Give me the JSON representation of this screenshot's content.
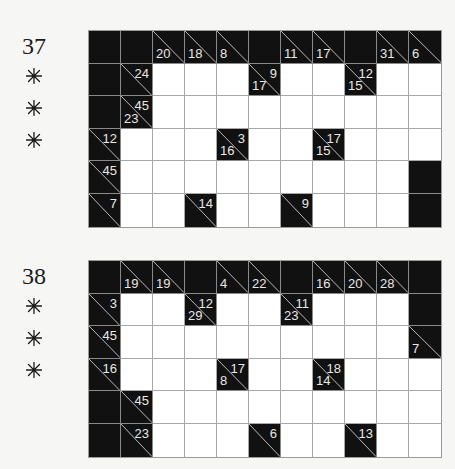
{
  "puzzles": [
    {
      "number": "37",
      "difficulty_icon": "asterisk-icon",
      "difficulty_stars": 3,
      "rows": 6,
      "cols": 11,
      "grid": [
        [
          {
            "t": "B"
          },
          {
            "t": "B"
          },
          {
            "t": "C",
            "down": "20"
          },
          {
            "t": "C",
            "down": "18"
          },
          {
            "t": "C",
            "down": "8"
          },
          {
            "t": "B"
          },
          {
            "t": "C",
            "down": "11"
          },
          {
            "t": "C",
            "down": "17"
          },
          {
            "t": "B"
          },
          {
            "t": "C",
            "down": "31"
          },
          {
            "t": "C",
            "down": "6"
          }
        ],
        [
          {
            "t": "B"
          },
          {
            "t": "C",
            "across": "24"
          },
          {
            "t": "W"
          },
          {
            "t": "W"
          },
          {
            "t": "W"
          },
          {
            "t": "C",
            "across": "9",
            "down": "17"
          },
          {
            "t": "W"
          },
          {
            "t": "W"
          },
          {
            "t": "C",
            "across": "12",
            "down": "15"
          },
          {
            "t": "W"
          },
          {
            "t": "W"
          }
        ],
        [
          {
            "t": "B"
          },
          {
            "t": "C",
            "across": "45",
            "down": "23"
          },
          {
            "t": "W"
          },
          {
            "t": "W"
          },
          {
            "t": "W"
          },
          {
            "t": "W"
          },
          {
            "t": "W"
          },
          {
            "t": "W"
          },
          {
            "t": "W"
          },
          {
            "t": "W"
          },
          {
            "t": "W"
          }
        ],
        [
          {
            "t": "C",
            "across": "12"
          },
          {
            "t": "W"
          },
          {
            "t": "W"
          },
          {
            "t": "W"
          },
          {
            "t": "C",
            "across": "3",
            "down": "16"
          },
          {
            "t": "W"
          },
          {
            "t": "W"
          },
          {
            "t": "C",
            "across": "17",
            "down": "15"
          },
          {
            "t": "W"
          },
          {
            "t": "W"
          },
          {
            "t": "W"
          }
        ],
        [
          {
            "t": "C",
            "across": "45"
          },
          {
            "t": "W"
          },
          {
            "t": "W"
          },
          {
            "t": "W"
          },
          {
            "t": "W"
          },
          {
            "t": "W"
          },
          {
            "t": "W"
          },
          {
            "t": "W"
          },
          {
            "t": "W"
          },
          {
            "t": "W"
          },
          {
            "t": "B"
          }
        ],
        [
          {
            "t": "C",
            "across": "7"
          },
          {
            "t": "W"
          },
          {
            "t": "W"
          },
          {
            "t": "C",
            "across": "14"
          },
          {
            "t": "W"
          },
          {
            "t": "W"
          },
          {
            "t": "C",
            "across": "9"
          },
          {
            "t": "W"
          },
          {
            "t": "W"
          },
          {
            "t": "W"
          },
          {
            "t": "B"
          }
        ]
      ]
    },
    {
      "number": "38",
      "difficulty_icon": "asterisk-icon",
      "difficulty_stars": 3,
      "rows": 6,
      "cols": 11,
      "grid": [
        [
          {
            "t": "B"
          },
          {
            "t": "C",
            "down": "19"
          },
          {
            "t": "C",
            "down": "19"
          },
          {
            "t": "B"
          },
          {
            "t": "C",
            "down": "4"
          },
          {
            "t": "C",
            "down": "22"
          },
          {
            "t": "B"
          },
          {
            "t": "C",
            "down": "16"
          },
          {
            "t": "C",
            "down": "20"
          },
          {
            "t": "C",
            "down": "28"
          },
          {
            "t": "B"
          }
        ],
        [
          {
            "t": "C",
            "across": "3"
          },
          {
            "t": "W"
          },
          {
            "t": "W"
          },
          {
            "t": "C",
            "across": "12",
            "down": "29"
          },
          {
            "t": "W"
          },
          {
            "t": "W"
          },
          {
            "t": "C",
            "across": "11",
            "down": "23"
          },
          {
            "t": "W"
          },
          {
            "t": "W"
          },
          {
            "t": "W"
          },
          {
            "t": "B"
          }
        ],
        [
          {
            "t": "C",
            "across": "45"
          },
          {
            "t": "W"
          },
          {
            "t": "W"
          },
          {
            "t": "W"
          },
          {
            "t": "W"
          },
          {
            "t": "W"
          },
          {
            "t": "W"
          },
          {
            "t": "W"
          },
          {
            "t": "W"
          },
          {
            "t": "W"
          },
          {
            "t": "C",
            "down": "7"
          }
        ],
        [
          {
            "t": "C",
            "across": "16"
          },
          {
            "t": "W"
          },
          {
            "t": "W"
          },
          {
            "t": "W"
          },
          {
            "t": "C",
            "across": "17",
            "down": "8"
          },
          {
            "t": "W"
          },
          {
            "t": "W"
          },
          {
            "t": "C",
            "across": "18",
            "down": "14"
          },
          {
            "t": "W"
          },
          {
            "t": "W"
          },
          {
            "t": "W"
          }
        ],
        [
          {
            "t": "B"
          },
          {
            "t": "C",
            "across": "45"
          },
          {
            "t": "W"
          },
          {
            "t": "W"
          },
          {
            "t": "W"
          },
          {
            "t": "W"
          },
          {
            "t": "W"
          },
          {
            "t": "W"
          },
          {
            "t": "W"
          },
          {
            "t": "W"
          },
          {
            "t": "W"
          }
        ],
        [
          {
            "t": "B"
          },
          {
            "t": "C",
            "across": "23"
          },
          {
            "t": "W"
          },
          {
            "t": "W"
          },
          {
            "t": "W"
          },
          {
            "t": "C",
            "across": "6"
          },
          {
            "t": "W"
          },
          {
            "t": "W"
          },
          {
            "t": "C",
            "across": "13"
          },
          {
            "t": "W"
          },
          {
            "t": "W"
          }
        ]
      ]
    }
  ]
}
